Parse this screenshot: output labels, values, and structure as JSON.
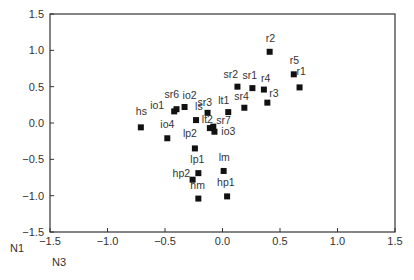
{
  "chart_data": {
    "type": "scatter",
    "title": "",
    "xlabel": "N3",
    "ylabel": "N1",
    "xlim": [
      -1.5,
      1.5
    ],
    "ylim": [
      -1.5,
      1.5
    ],
    "xticks": [
      "-1.5",
      "-1.0",
      "-0.5",
      "0.0",
      "0.5",
      "1.0",
      "1.5"
    ],
    "yticks": [
      "1.5",
      "1.0",
      "0.5",
      "0.0",
      "-0.5",
      "-1.0",
      "-1.5"
    ],
    "grid": false,
    "legend": null,
    "marker": "square",
    "marker_color": "#111111",
    "points": [
      {
        "label": "r2",
        "x": 0.41,
        "y": 0.98,
        "lx": -4,
        "ly": -10
      },
      {
        "label": "r5",
        "x": 0.62,
        "y": 0.67,
        "lx": -4,
        "ly": -10
      },
      {
        "label": "r1",
        "x": 0.67,
        "y": 0.49,
        "lx": -3,
        "ly": -12
      },
      {
        "label": "sr2",
        "x": 0.13,
        "y": 0.5,
        "lx": -14,
        "ly": -9
      },
      {
        "label": "sr1",
        "x": 0.26,
        "y": 0.48,
        "lx": -10,
        "ly": -9
      },
      {
        "label": "r4",
        "x": 0.36,
        "y": 0.46,
        "lx": -3,
        "ly": -8
      },
      {
        "label": "r3",
        "x": 0.39,
        "y": 0.28,
        "lx": 2,
        "ly": -6
      },
      {
        "label": "sr4",
        "x": 0.19,
        "y": 0.21,
        "lx": -10,
        "ly": -8
      },
      {
        "label": "lt1",
        "x": 0.05,
        "y": 0.15,
        "lx": -10,
        "ly": -8
      },
      {
        "label": "sr7",
        "x": 0.05,
        "y": 0.15,
        "lx": -12,
        "ly": 12,
        "label_only": true
      },
      {
        "label": "sr3",
        "x": -0.13,
        "y": 0.14,
        "lx": -10,
        "ly": -7
      },
      {
        "label": "io2",
        "x": -0.33,
        "y": 0.22,
        "lx": -2,
        "ly": -8
      },
      {
        "label": "sr6",
        "x": -0.4,
        "y": 0.19,
        "lx": -12,
        "ly": -11
      },
      {
        "label": "io1",
        "x": -0.42,
        "y": 0.16,
        "lx": -24,
        "ly": -2
      },
      {
        "label": "hs",
        "x": -0.71,
        "y": -0.06,
        "lx": -5,
        "ly": -12
      },
      {
        "label": "ls",
        "x": -0.23,
        "y": 0.04,
        "lx": -1,
        "ly": -10
      },
      {
        "label": "lt2",
        "x": -0.11,
        "y": -0.07,
        "lx": -8,
        "ly": -5
      },
      {
        "label": "io3",
        "x": -0.08,
        "y": -0.05,
        "lx": 8,
        "ly": 8
      },
      {
        "label": "",
        "x": -0.07,
        "y": -0.12,
        "lx": 0,
        "ly": 0
      },
      {
        "label": "io4",
        "x": -0.48,
        "y": -0.21,
        "lx": -7,
        "ly": -10
      },
      {
        "label": "lp2",
        "x": -0.24,
        "y": -0.35,
        "lx": -12,
        "ly": -11
      },
      {
        "label": "lp1",
        "x": -0.21,
        "y": -0.69,
        "lx": -8,
        "ly": -10
      },
      {
        "label": "hp2",
        "x": -0.26,
        "y": -0.78,
        "lx": -20,
        "ly": -3
      },
      {
        "label": "lm",
        "x": 0.01,
        "y": -0.66,
        "lx": -5,
        "ly": -10
      },
      {
        "label": "hm",
        "x": -0.21,
        "y": -1.04,
        "lx": -8,
        "ly": -10
      },
      {
        "label": "hp1",
        "x": 0.04,
        "y": -1.01,
        "lx": -10,
        "ly": -10
      }
    ]
  },
  "axes": {
    "x_label": "N3",
    "y_label": "N1"
  }
}
